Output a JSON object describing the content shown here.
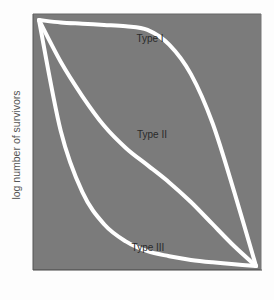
{
  "chart_data": {
    "type": "line",
    "title": "",
    "xlabel": "",
    "ylabel": "log number of survivors",
    "grid": false,
    "legend": "none (curves labeled inline)",
    "background_color": "#7b7b7b",
    "line_color": "#ffffff",
    "x": [
      0,
      0.1,
      0.2,
      0.3,
      0.4,
      0.5,
      0.6,
      0.7,
      0.8,
      0.9,
      1.0
    ],
    "xlim": [
      0,
      1
    ],
    "ylim": [
      0,
      1
    ],
    "series": [
      {
        "name": "Type I",
        "values": [
          1.0,
          0.99,
          0.985,
          0.98,
          0.975,
          0.96,
          0.9,
          0.78,
          0.58,
          0.3,
          0.0
        ]
      },
      {
        "name": "Type II",
        "values": [
          1.0,
          0.83,
          0.69,
          0.57,
          0.48,
          0.41,
          0.34,
          0.26,
          0.17,
          0.08,
          0.0
        ]
      },
      {
        "name": "Type III",
        "values": [
          1.0,
          0.55,
          0.3,
          0.17,
          0.1,
          0.06,
          0.04,
          0.025,
          0.015,
          0.007,
          0.0
        ]
      }
    ],
    "annotations": [
      {
        "text": "Type I",
        "x": 0.51,
        "y": 0.96
      },
      {
        "text": "Type II",
        "x": 0.52,
        "y": 0.5
      },
      {
        "text": "Type III",
        "x": 0.51,
        "y": 0.1
      }
    ]
  },
  "labels": {
    "ylabel": "log number of survivors",
    "type1": "Type I",
    "type2": "Type II",
    "type3": "Type III"
  }
}
